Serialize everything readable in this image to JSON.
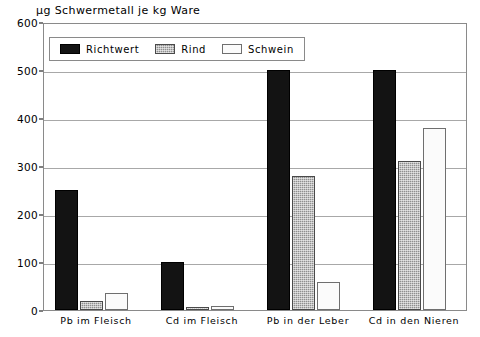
{
  "chart_data": {
    "type": "bar",
    "title": "µg Schwermetall je kg Ware",
    "xlabel": "",
    "ylabel": "",
    "ylim": [
      0,
      600
    ],
    "ytick_step": 100,
    "yticks": [
      "600",
      "500",
      "400",
      "300",
      "200",
      "100",
      "0"
    ],
    "grid": true,
    "legend_position": "top-left-inside",
    "categories": [
      "Pb im Fleisch",
      "Cd im Fleisch",
      "Pb in der Leber",
      "Cd in den Nieren"
    ],
    "series": [
      {
        "name": "Richtwert",
        "color": "#131313",
        "pattern": "solid-black",
        "values": [
          250,
          100,
          500,
          500
        ]
      },
      {
        "name": "Rind",
        "color": "#8f8f8f",
        "pattern": "hatched-gray",
        "values": [
          18,
          6,
          280,
          310
        ]
      },
      {
        "name": "Schwein",
        "color": "#fbfbfb",
        "pattern": "open-white",
        "values": [
          35,
          8,
          58,
          380
        ]
      }
    ]
  },
  "legend": {
    "items": [
      {
        "label": "Richtwert"
      },
      {
        "label": "Rind"
      },
      {
        "label": "Schwein"
      }
    ]
  }
}
